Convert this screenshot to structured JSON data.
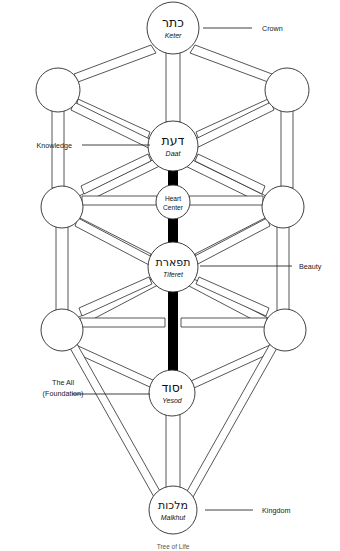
{
  "diagram": {
    "title": "Tree of Life",
    "caption": "Tree of Life",
    "colors": {
      "stroke": "#2b2b2b",
      "fill": "#ffffff",
      "accent_bar": "#000000",
      "text": "#1a1a1a"
    },
    "nodes": [
      {
        "id": "keter",
        "hebrew": "כתר",
        "translit": "Keter",
        "cx": 173,
        "cy": 28,
        "r": 26
      },
      {
        "id": "left-top",
        "hebrew": "",
        "translit": "",
        "cx": 58,
        "cy": 90,
        "r": 22
      },
      {
        "id": "right-top",
        "hebrew": "",
        "translit": "",
        "cx": 287,
        "cy": 90,
        "r": 22
      },
      {
        "id": "daat",
        "hebrew": "דעת",
        "translit": "Daat",
        "cx": 173,
        "cy": 146,
        "r": 25
      },
      {
        "id": "left-mid",
        "hebrew": "",
        "translit": "",
        "cx": 62,
        "cy": 207,
        "r": 21
      },
      {
        "id": "right-mid",
        "hebrew": "",
        "translit": "",
        "cx": 283,
        "cy": 207,
        "r": 21
      },
      {
        "id": "heart",
        "hebrew": "",
        "translit": "",
        "cx": 173,
        "cy": 202,
        "r": 17
      },
      {
        "id": "tiferet",
        "hebrew": "תפארת",
        "translit": "Tiferet",
        "cx": 173,
        "cy": 267,
        "r": 25
      },
      {
        "id": "left-low",
        "hebrew": "",
        "translit": "",
        "cx": 62,
        "cy": 330,
        "r": 21
      },
      {
        "id": "right-low",
        "hebrew": "",
        "translit": "",
        "cx": 285,
        "cy": 330,
        "r": 21
      },
      {
        "id": "yesod",
        "hebrew": "יסוד",
        "translit": "Yesod",
        "cx": 172,
        "cy": 393,
        "r": 23
      },
      {
        "id": "malkhut",
        "hebrew": "מלכות",
        "translit": "Malkhut",
        "cx": 173,
        "cy": 510,
        "r": 24
      }
    ],
    "heart_center": {
      "line1": "Heart",
      "line2": "Center"
    },
    "annotations": [
      {
        "id": "crown",
        "label": "Crown",
        "side": "right",
        "text_x": 262,
        "text_y": 31,
        "line_x1": 203,
        "line_x2": 252,
        "line_y": 28
      },
      {
        "id": "knowledge",
        "label": "Knowledge",
        "side": "left",
        "text_x": 72,
        "text_y": 148,
        "line_x1": 82,
        "line_x2": 150,
        "line_y": 145
      },
      {
        "id": "beauty",
        "label": "Beauty",
        "side": "right",
        "text_x": 299,
        "text_y": 269,
        "line_x1": 200,
        "line_x2": 292,
        "line_y": 266
      },
      {
        "id": "foundation",
        "label": "The All",
        "label2": "(Foundation)",
        "side": "left",
        "text_x": 63,
        "text_y": 385,
        "text_y2": 396,
        "line_x1": 72,
        "line_x2": 150,
        "line_y": 394
      },
      {
        "id": "kingdom",
        "label": "Kingdom",
        "side": "right",
        "text_x": 262,
        "text_y": 513,
        "line_x1": 205,
        "line_x2": 253,
        "line_y": 510
      }
    ]
  }
}
